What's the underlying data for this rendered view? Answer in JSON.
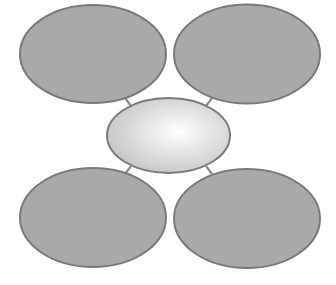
{
  "diagram": {
    "type": "hub-and-spoke",
    "width": 336,
    "height": 285,
    "colors": {
      "background": "#ffffff",
      "outer_fill": "#a9a9a9",
      "outer_stroke": "#7a7a7a",
      "center_fill_inner": "#ffffff",
      "center_fill_outer": "#c4c4c4",
      "center_stroke": "#7a7a7a",
      "connector_stroke": "#8a8a8a"
    },
    "center_node": {
      "id": "center",
      "label": "",
      "cx": 168.5,
      "cy": 135.5,
      "rx": 61.5,
      "ry": 37.5
    },
    "outer_nodes": [
      {
        "id": "top-left",
        "label": "",
        "cx": 93,
        "cy": 54,
        "rx": 73,
        "ry": 49
      },
      {
        "id": "top-right",
        "label": "",
        "cx": 247,
        "cy": 54,
        "rx": 73,
        "ry": 49.5
      },
      {
        "id": "bottom-left",
        "label": "",
        "cx": 93,
        "cy": 217.5,
        "rx": 73,
        "ry": 49.5
      },
      {
        "id": "bottom-right",
        "label": "",
        "cx": 247,
        "cy": 218.5,
        "rx": 73,
        "ry": 49.5
      }
    ],
    "connectors": [
      {
        "from": "center",
        "to": "top-left",
        "x1": 131,
        "y1": 106,
        "x2": 125,
        "y2": 98
      },
      {
        "from": "center",
        "to": "top-right",
        "x1": 206,
        "y1": 106,
        "x2": 212,
        "y2": 98
      },
      {
        "from": "center",
        "to": "bottom-left",
        "x1": 131,
        "y1": 166,
        "x2": 125,
        "y2": 174
      },
      {
        "from": "center",
        "to": "bottom-right",
        "x1": 206,
        "y1": 166,
        "x2": 212,
        "y2": 174
      }
    ]
  }
}
